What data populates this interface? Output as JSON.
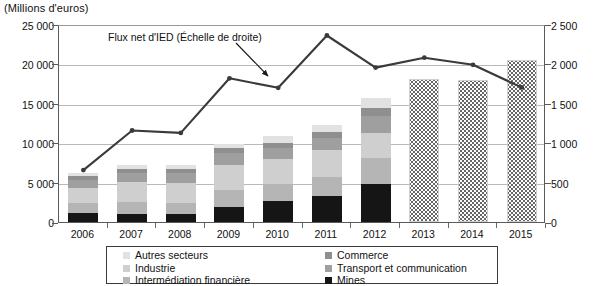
{
  "axis_unit_label": "(Millions d'euros)",
  "annotation": {
    "text": "Flux net d'IED (Échelle de droite)"
  },
  "legend": {
    "column_left": [
      {
        "label": "Autres secteurs",
        "swatch": "autres",
        "color": "#e2e2e2"
      },
      {
        "label": "Industrie",
        "swatch": "industrie",
        "color": "#cfcfcf"
      },
      {
        "label": "Intermédiation financière",
        "swatch": "interm",
        "color": "#b5b5b5"
      }
    ],
    "column_right": [
      {
        "label": "Commerce",
        "swatch": "commerce",
        "color": "#8f8f8f"
      },
      {
        "label": "Transport et communication",
        "swatch": "transport",
        "color": "#9f9f9f"
      },
      {
        "label": "Mines",
        "swatch": "mines",
        "color": "#151515"
      }
    ]
  },
  "chart_data": {
    "type": "bar",
    "title": "",
    "subtitle": "(Millions d'euros)",
    "xlabel": "",
    "ylabel": "Millions d'euros",
    "ylabel_right": "Millions d'euros",
    "categories": [
      "2006",
      "2007",
      "2008",
      "2009",
      "2010",
      "2011",
      "2012",
      "2013",
      "2014",
      "2015"
    ],
    "ylim": [
      0,
      25000
    ],
    "yticks": [
      "0",
      "5 000",
      "10 000",
      "15 000",
      "20 000",
      "25 000"
    ],
    "ylim_right": [
      0,
      2500
    ],
    "yticks_right": [
      "0",
      "500",
      "1 000",
      "1 500",
      "2 000",
      "2 500"
    ],
    "grid": true,
    "legend_position": "bottom",
    "stacked": true,
    "series": [
      {
        "name": "Mines",
        "axis": "left",
        "color": "#151515",
        "values": [
          1150,
          1000,
          1050,
          1850,
          2700,
          3300,
          4850,
          null,
          null,
          null
        ]
      },
      {
        "name": "Intermédiation financière",
        "axis": "left",
        "color": "#b5b5b5",
        "values": [
          1250,
          1500,
          1400,
          2200,
          2100,
          2400,
          3200,
          null,
          null,
          null
        ]
      },
      {
        "name": "Industrie",
        "axis": "left",
        "color": "#cfcfcf",
        "values": [
          1900,
          2500,
          2500,
          3100,
          3200,
          3400,
          3150,
          null,
          null,
          null
        ]
      },
      {
        "name": "Transport et communication",
        "axis": "left",
        "color": "#9f9f9f",
        "values": [
          1050,
          1200,
          1200,
          1600,
          1300,
          1550,
          2200,
          null,
          null,
          null
        ]
      },
      {
        "name": "Commerce",
        "axis": "left",
        "color": "#8f8f8f",
        "values": [
          450,
          500,
          500,
          550,
          650,
          750,
          1000,
          null,
          null,
          null
        ]
      },
      {
        "name": "Autres secteurs",
        "axis": "left",
        "color": "#e2e2e2",
        "values": [
          400,
          500,
          550,
          600,
          900,
          850,
          1300,
          null,
          null,
          null
        ]
      },
      {
        "name": "Projection (stock total)",
        "axis": "left",
        "color": "#dotted",
        "values": [
          null,
          null,
          null,
          null,
          null,
          null,
          null,
          18000,
          17900,
          20400
        ]
      },
      {
        "name": "Flux net d'IED (Échelle de droite)",
        "axis": "right",
        "color": "#3a3a3a",
        "values": [
          680,
          1180,
          1150,
          1840,
          1720,
          2380,
          1975,
          2100,
          2010,
          1725
        ]
      }
    ],
    "stack_totals": [
      6200,
      7200,
      7200,
      9900,
      10850,
      12250,
      15700,
      18000,
      17900,
      20400
    ],
    "annotations": [
      {
        "text": "Flux net d'IED (Échelle de droite)",
        "target_category": "2011"
      }
    ]
  }
}
